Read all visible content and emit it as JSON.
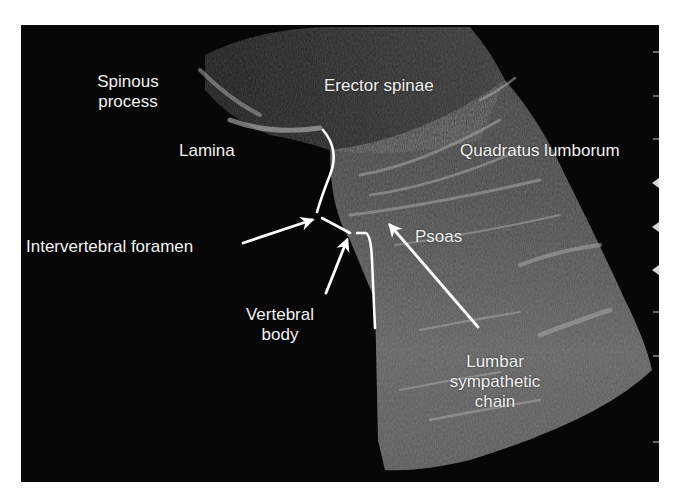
{
  "figure": {
    "type": "ultrasound-image",
    "colors": {
      "background": "#ffffff",
      "panel": "#070707",
      "tissue_dark": "#3a3a3a",
      "tissue_mid": "#5a5a5a",
      "tissue_bright": "#9a9a9a",
      "annotation": "#ffffff"
    },
    "labels": [
      {
        "id": "spinous-process",
        "lines": [
          "Spinous",
          "process"
        ]
      },
      {
        "id": "erector-spinae",
        "lines": [
          "Erector spinae"
        ]
      },
      {
        "id": "lamina",
        "lines": [
          "Lamina"
        ]
      },
      {
        "id": "quadratus-lumborum",
        "lines": [
          "Quadratus lumborum"
        ]
      },
      {
        "id": "intervertebral-foramen",
        "lines": [
          "Intervertebral foramen"
        ]
      },
      {
        "id": "psoas",
        "lines": [
          "Psoas"
        ]
      },
      {
        "id": "vertebral-body",
        "lines": [
          "Vertebral",
          "body"
        ]
      },
      {
        "id": "lumbar-sympathetic-chain",
        "lines": [
          "Lumbar",
          "sympathetic",
          "chain"
        ]
      }
    ],
    "depth_markers": {
      "ticks": 9,
      "focus_arrows": 3
    }
  }
}
